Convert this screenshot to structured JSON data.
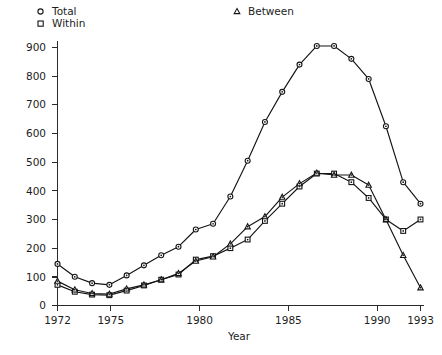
{
  "chart_data": {
    "type": "line",
    "title": "",
    "xlabel": "Year",
    "ylabel": "",
    "xlim": [
      1972,
      1993
    ],
    "ylim": [
      0,
      950
    ],
    "grid": false,
    "legend_position": "top",
    "x": [
      1972,
      1973,
      1974,
      1975,
      1976,
      1977,
      1978,
      1979,
      1980,
      1981,
      1982,
      1983,
      1984,
      1985,
      1986,
      1987,
      1988,
      1989,
      1990,
      1991,
      1992,
      1993
    ],
    "xticks": [
      1972,
      1975,
      1980,
      1985,
      1990,
      1993
    ],
    "yticks": [
      0,
      100,
      200,
      300,
      400,
      500,
      600,
      700,
      800,
      900
    ],
    "series": [
      {
        "name": "Total",
        "marker": "circle",
        "values": [
          145,
          100,
          78,
          72,
          105,
          140,
          175,
          205,
          265,
          285,
          380,
          505,
          640,
          745,
          840,
          905,
          905,
          860,
          790,
          625,
          430,
          355
        ]
      },
      {
        "name": "Within",
        "marker": "square",
        "values": [
          72,
          48,
          38,
          36,
          52,
          70,
          90,
          108,
          160,
          172,
          200,
          230,
          295,
          355,
          415,
          460,
          460,
          430,
          375,
          300,
          260,
          300
        ]
      },
      {
        "name": "Between",
        "marker": "triangle",
        "values": [
          85,
          55,
          42,
          40,
          58,
          72,
          90,
          112,
          155,
          170,
          215,
          275,
          310,
          378,
          425,
          462,
          455,
          455,
          420,
          300,
          175,
          62
        ]
      }
    ]
  },
  "legend": {
    "items": [
      {
        "label": "Total",
        "marker": "circle"
      },
      {
        "label": "Within",
        "marker": "square"
      },
      {
        "label": "Between",
        "marker": "triangle"
      }
    ]
  },
  "axes": {
    "x_title": "Year",
    "x_tick_labels": [
      "1972",
      "1975",
      "1980",
      "1985",
      "1990",
      "1993"
    ],
    "y_tick_labels": [
      "0",
      "100",
      "200",
      "300",
      "400",
      "500",
      "600",
      "700",
      "800",
      "900"
    ]
  },
  "colors": {
    "ink": "#141414",
    "axis": "#2a2a2a",
    "background": "#ffffff"
  }
}
